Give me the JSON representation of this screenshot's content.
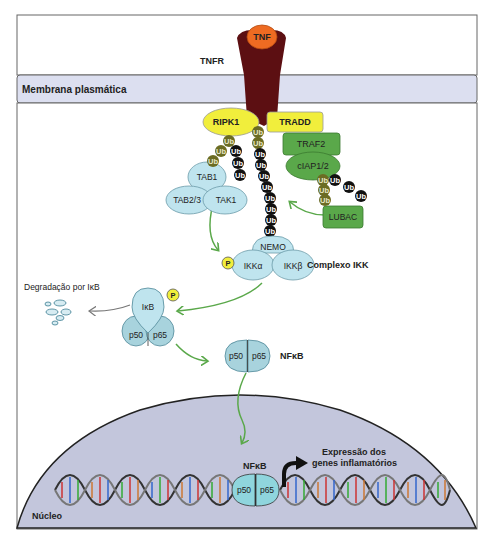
{
  "colors": {
    "membrane": "#dcdff0",
    "receptor": "#5c0f12",
    "tnf": "#ee6b22",
    "yellow": "#f1ee3c",
    "green_protein": "#5aa84a",
    "blue_protein": "#bfe4ee",
    "blue_dark": "#a8d3dd",
    "ub_olive": "#6b6c23",
    "ub_black": "#111111",
    "arrow_green": "#5aa84a",
    "nucleus": "#c3c6dc"
  },
  "labels": {
    "tnf": "TNF",
    "tnfr": "TNFR",
    "membrane": "Membrana plasmática",
    "ripk1": "RIPK1",
    "tradd": "TRADD",
    "traf2": "TRAF2",
    "ciap": "cIAP1/2",
    "lubac": "LUBAC",
    "tab1": "TAB1",
    "tab23": "TAB2/3",
    "tak1": "TAK1",
    "nemo": "NEMO",
    "ikka": "IKKα",
    "ikkb": "IKKβ",
    "ikk_complex": "Complexo IKK",
    "p": "P",
    "ub": "Ub",
    "degradation": "Degradação por IκB",
    "ikb": "IκB",
    "p50": "p50",
    "p65": "p65",
    "nfkb": "NFκB",
    "expression_line1": "Expressão dos",
    "expression_line2": "genes inflamatórios",
    "nucleus": "Núcleo"
  }
}
